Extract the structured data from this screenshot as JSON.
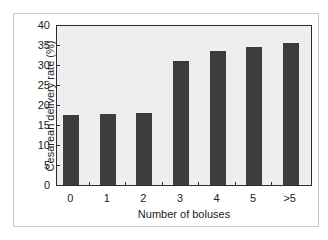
{
  "chart_data": {
    "type": "bar",
    "title": "",
    "xlabel": "Number of boluses",
    "ylabel": "Cesarean delivery rate (%)",
    "categories": [
      "0",
      "1",
      "2",
      "3",
      "4",
      "5",
      ">5"
    ],
    "values": [
      17.5,
      17.8,
      18.0,
      31.0,
      33.5,
      34.5,
      35.5
    ],
    "ylim": [
      0,
      40
    ],
    "yticks": [
      0,
      5,
      10,
      15,
      20,
      25,
      30,
      35,
      40
    ],
    "grid": false,
    "legend": null,
    "colors": {
      "bar": "#3d3d3d",
      "plot_bg": "#eeeeee",
      "axis": "#2b2b2b"
    }
  },
  "labels": {
    "xlabel": "Number of boluses",
    "ylabel": "Cesarean delivery rate (%)",
    "xticks": [
      "0",
      "1",
      "2",
      "3",
      "4",
      "5",
      ">5"
    ],
    "yticks": [
      "0",
      "5",
      "10",
      "15",
      "20",
      "25",
      "30",
      "35",
      "40"
    ]
  }
}
